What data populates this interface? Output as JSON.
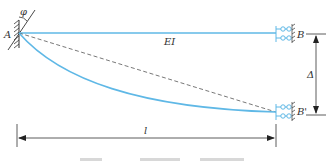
{
  "diagram": {
    "type": "beam-deflection",
    "colors": {
      "beam": "#5fb8e6",
      "ink": "#333333",
      "chord": "#555555"
    },
    "labels": {
      "left_support": "A",
      "angle": "φ",
      "right_support_original": "B",
      "right_support_displaced": "B'",
      "stiffness": "EI",
      "displacement": "Δ",
      "length": "l"
    },
    "elements": [
      {
        "name": "beam-original",
        "description": "straight beam from A to B"
      },
      {
        "name": "beam-deflected",
        "description": "curved deflected beam from A to B'"
      },
      {
        "name": "chord-line",
        "description": "dashed line from A to B'"
      },
      {
        "name": "fixed-support-A",
        "description": "hatched fixed support at A with rotation φ"
      },
      {
        "name": "roller-support-B",
        "description": "roller/guided support at B"
      },
      {
        "name": "roller-support-B-prime",
        "description": "roller/guided support at B'"
      },
      {
        "name": "displacement-dimension",
        "description": "vertical dimension Δ between B and B'"
      },
      {
        "name": "length-dimension",
        "description": "horizontal dimension l"
      }
    ]
  }
}
